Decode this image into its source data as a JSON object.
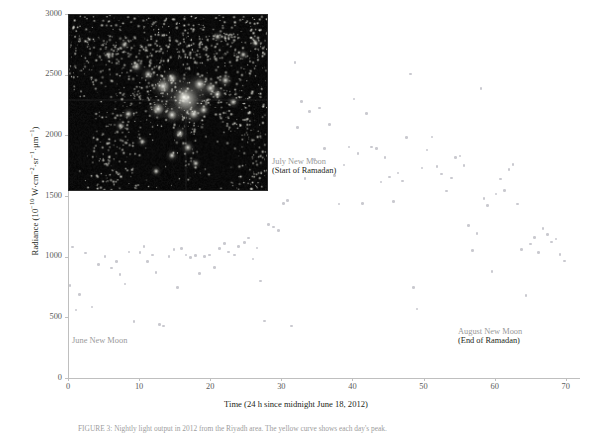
{
  "figure": {
    "title_caption": "FIGURE 3: Nightly light output in 2012 from the Riyadh area. The yellow curve shows each day's peak."
  },
  "chart_data": {
    "type": "scatter",
    "title": "",
    "xlabel": "Time (24 h since midnight June 18, 2012)",
    "ylabel_text": "Radiance (10",
    "ylabel_exp1": "−10",
    "ylabel_mid": " W·cm",
    "ylabel_exp2": "−2",
    "ylabel_mid2": "·sr",
    "ylabel_exp3": "−1",
    "ylabel_mid3": "·μm",
    "ylabel_exp4": "−1",
    "ylabel_end": ")",
    "xlim": [
      0,
      72
    ],
    "ylim": [
      0,
      3000
    ],
    "xticks": [
      0,
      10,
      20,
      30,
      40,
      50,
      60,
      70
    ],
    "yticks": [
      0,
      500,
      1000,
      1500,
      2000,
      2500,
      3000
    ],
    "grid": false,
    "legend": "none",
    "marker_color": "#c9c9cf",
    "axis_color": "#bfbfbf",
    "points": [
      [
        0.3,
        760
      ],
      [
        0.6,
        1080
      ],
      [
        1.1,
        560
      ],
      [
        1.6,
        690
      ],
      [
        2.5,
        1030
      ],
      [
        3.4,
        585
      ],
      [
        4.3,
        935
      ],
      [
        5.2,
        1000
      ],
      [
        6.1,
        905
      ],
      [
        6.8,
        960
      ],
      [
        7.3,
        855
      ],
      [
        8.0,
        775
      ],
      [
        8.6,
        1040
      ],
      [
        9.3,
        465
      ],
      [
        10.1,
        1035
      ],
      [
        10.7,
        1085
      ],
      [
        11.2,
        960
      ],
      [
        11.9,
        1015
      ],
      [
        12.4,
        870
      ],
      [
        12.9,
        440
      ],
      [
        13.4,
        430
      ],
      [
        14.2,
        1000
      ],
      [
        14.9,
        1060
      ],
      [
        15.4,
        745
      ],
      [
        16.0,
        1065
      ],
      [
        16.6,
        1015
      ],
      [
        17.2,
        995
      ],
      [
        17.9,
        1010
      ],
      [
        18.5,
        860
      ],
      [
        19.2,
        1000
      ],
      [
        19.9,
        1015
      ],
      [
        20.6,
        910
      ],
      [
        21.3,
        1065
      ],
      [
        22.0,
        1110
      ],
      [
        22.6,
        1040
      ],
      [
        23.4,
        1015
      ],
      [
        24.0,
        1085
      ],
      [
        24.8,
        1115
      ],
      [
        25.4,
        1155
      ],
      [
        26.0,
        980
      ],
      [
        26.6,
        1070
      ],
      [
        27.1,
        800
      ],
      [
        27.6,
        470
      ],
      [
        28.2,
        1265
      ],
      [
        28.9,
        1245
      ],
      [
        29.6,
        1215
      ],
      [
        30.3,
        1440
      ],
      [
        30.9,
        1465
      ],
      [
        31.4,
        430
      ],
      [
        31.9,
        2600
      ],
      [
        32.3,
        2065
      ],
      [
        32.8,
        2280
      ],
      [
        33.3,
        1645
      ],
      [
        34.0,
        2195
      ],
      [
        34.7,
        1800
      ],
      [
        35.4,
        2225
      ],
      [
        36.1,
        1890
      ],
      [
        36.8,
        2090
      ],
      [
        37.5,
        1670
      ],
      [
        38.1,
        1435
      ],
      [
        38.8,
        1755
      ],
      [
        39.5,
        1905
      ],
      [
        40.2,
        2300
      ],
      [
        40.8,
        1850
      ],
      [
        41.4,
        1440
      ],
      [
        42.0,
        2180
      ],
      [
        42.7,
        1905
      ],
      [
        43.4,
        1890
      ],
      [
        44.0,
        1615
      ],
      [
        44.6,
        1815
      ],
      [
        45.2,
        1655
      ],
      [
        45.8,
        1455
      ],
      [
        46.4,
        1690
      ],
      [
        47.0,
        1625
      ],
      [
        47.6,
        1980
      ],
      [
        48.2,
        2505
      ],
      [
        48.6,
        745
      ],
      [
        49.1,
        570
      ],
      [
        49.8,
        1730
      ],
      [
        50.5,
        1880
      ],
      [
        51.2,
        1985
      ],
      [
        51.9,
        1745
      ],
      [
        52.5,
        1680
      ],
      [
        53.2,
        1540
      ],
      [
        53.9,
        1650
      ],
      [
        54.5,
        1815
      ],
      [
        55.1,
        1830
      ],
      [
        55.7,
        1750
      ],
      [
        56.3,
        1255
      ],
      [
        56.9,
        1050
      ],
      [
        57.5,
        1190
      ],
      [
        58.1,
        2385
      ],
      [
        58.5,
        1480
      ],
      [
        59.0,
        1420
      ],
      [
        59.6,
        880
      ],
      [
        60.2,
        1515
      ],
      [
        60.8,
        1640
      ],
      [
        61.4,
        1545
      ],
      [
        62.0,
        1720
      ],
      [
        62.6,
        1760
      ],
      [
        63.2,
        1435
      ],
      [
        63.8,
        1060
      ],
      [
        64.4,
        680
      ],
      [
        65.0,
        1105
      ],
      [
        65.6,
        1160
      ],
      [
        66.2,
        1035
      ],
      [
        66.8,
        1230
      ],
      [
        67.4,
        1185
      ],
      [
        68.0,
        1120
      ],
      [
        68.6,
        1145
      ],
      [
        69.2,
        1020
      ],
      [
        69.8,
        965
      ]
    ],
    "annotations": [
      {
        "id": "june",
        "gray": "June New Moon",
        "black": ""
      },
      {
        "id": "july",
        "gray": "July New Moon",
        "black": "(Start of Ramadan)"
      },
      {
        "id": "august",
        "gray": "August New Moon",
        "black": "(End of Ramadan)"
      }
    ],
    "inset": {
      "name": "night-lights-satellite-image",
      "description": "VIIRS nighttime lights satellite image of the Arabian peninsula"
    }
  }
}
